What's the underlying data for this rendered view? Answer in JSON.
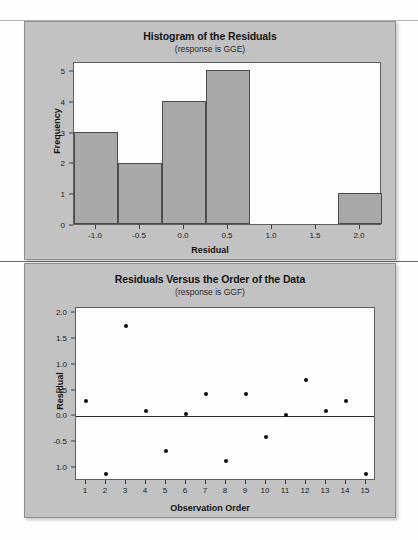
{
  "page": {
    "background": "#fefefe",
    "panel_background": "#c2c2c2",
    "plot_background": "#fdfdfd",
    "bar_fill": "#a8a8a8",
    "bar_stroke": "#4d4d4d",
    "point_color": "#0d0d0d",
    "axis_color": "#3a3a3a"
  },
  "chart_data": [
    {
      "type": "bar",
      "id": "histogram-of-residuals",
      "title": "Histogram of the Residuals",
      "subtitle": "(response is GGE)",
      "xlabel": "Residual",
      "ylabel": "Frequency",
      "xlim": [
        -1.25,
        2.25
      ],
      "ylim": [
        0,
        5.3
      ],
      "xticks": [
        "-1.0",
        "-0.5",
        "0.0",
        "0.5",
        "1.0",
        "1.5",
        "2.0"
      ],
      "xtick_values": [
        -1.0,
        -0.5,
        0.0,
        0.5,
        1.0,
        1.5,
        2.0
      ],
      "yticks": [
        "0",
        "1",
        "2",
        "3",
        "4",
        "5"
      ],
      "ytick_values": [
        0,
        1,
        2,
        3,
        4,
        5
      ],
      "grid": false,
      "legend": false,
      "bin_width": 0.5,
      "bins": [
        {
          "left": -1.25,
          "right": -0.75,
          "center": -1.0,
          "frequency": 3
        },
        {
          "left": -0.75,
          "right": -0.25,
          "center": -0.5,
          "frequency": 2
        },
        {
          "left": -0.25,
          "right": 0.25,
          "center": 0.0,
          "frequency": 4
        },
        {
          "left": 0.25,
          "right": 0.75,
          "center": 0.5,
          "frequency": 5
        },
        {
          "left": 1.75,
          "right": 2.25,
          "center": 2.0,
          "frequency": 1
        }
      ],
      "categories": [
        "-1.0",
        "-0.5",
        "0.0",
        "0.5",
        "2.0"
      ],
      "values": [
        3,
        2,
        4,
        5,
        1
      ]
    },
    {
      "type": "scatter",
      "id": "residuals-versus-order",
      "title": "Residuals Versus the Order of the Data",
      "subtitle": "(response is GGF)",
      "xlabel": "Observation Order",
      "ylabel": "Residual",
      "xlim": [
        0.5,
        15.5
      ],
      "ylim": [
        -1.25,
        2.1
      ],
      "xticks": [
        "1",
        "2",
        "3",
        "4",
        "5",
        "6",
        "7",
        "8",
        "9",
        "10",
        "11",
        "12",
        "13",
        "14",
        "15"
      ],
      "xtick_values": [
        1,
        2,
        3,
        4,
        5,
        6,
        7,
        8,
        9,
        10,
        11,
        12,
        13,
        14,
        15
      ],
      "yticks": [
        "2.0",
        "1.5",
        "1.0",
        "0.5",
        "0.0",
        "-0.5",
        "1.0"
      ],
      "ytick_values": [
        2.0,
        1.5,
        1.0,
        0.5,
        0.0,
        -0.5,
        -1.0
      ],
      "reference_line": 0.0,
      "grid": false,
      "legend": false,
      "x": [
        1,
        2,
        3,
        4,
        5,
        6,
        7,
        8,
        9,
        10,
        11,
        12,
        13,
        14,
        15
      ],
      "y": [
        0.3,
        -1.12,
        1.76,
        0.11,
        -0.67,
        0.05,
        0.43,
        -0.87,
        0.43,
        -0.39,
        0.02,
        0.7,
        0.11,
        0.3,
        -1.12
      ]
    }
  ]
}
